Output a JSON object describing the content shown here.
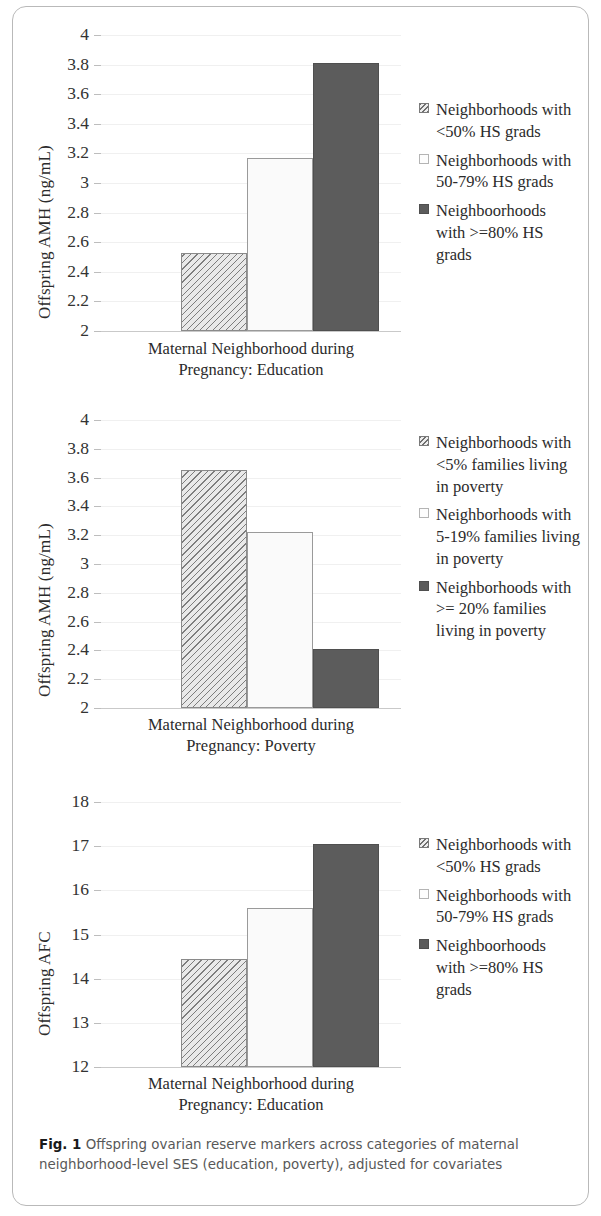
{
  "figure": {
    "caption_label": "Fig. 1",
    "caption_text": " Offspring ovarian reserve markers across categories of maternal neighborhood-level SES (education, poverty), adjusted for covariates"
  },
  "chart_data": [
    {
      "type": "bar",
      "title": "",
      "xlabel": "Maternal Neighborhood during Pregnancy: Education",
      "ylabel": "Offspring AMH (ng/mL)",
      "ylim": [
        2,
        4
      ],
      "ytick_labels": [
        "4",
        "3.8",
        "3.6",
        "3.4",
        "3.2",
        "3",
        "2.8",
        "2.6",
        "2.4",
        "2.2",
        "2"
      ],
      "ytick_values": [
        4,
        3.8,
        3.6,
        3.4,
        3.2,
        3,
        2.8,
        2.6,
        2.4,
        2.2,
        2
      ],
      "grid": true,
      "legend_position": "right",
      "categories": [
        "Neighborhoods with <50% HS grads",
        "Neighborhoods with 50-79% HS grads",
        "Neighboorhoods with >=80% HS grads"
      ],
      "values": [
        2.53,
        3.17,
        3.81
      ],
      "bar_styles": [
        "hatch",
        "white",
        "dark"
      ]
    },
    {
      "type": "bar",
      "title": "",
      "xlabel": "Maternal Neighborhood during Pregnancy: Poverty",
      "ylabel": "Offspring AMH (ng/mL)",
      "ylim": [
        2,
        4
      ],
      "ytick_labels": [
        "4",
        "3.8",
        "3.6",
        "3.4",
        "3.2",
        "3",
        "2.8",
        "2.6",
        "2.4",
        "2.2",
        "2"
      ],
      "ytick_values": [
        4,
        3.8,
        3.6,
        3.4,
        3.2,
        3,
        2.8,
        2.6,
        2.4,
        2.2,
        2
      ],
      "grid": true,
      "legend_position": "right",
      "categories": [
        "Neighborhoods with <5% families living in poverty",
        "Neighborhoods with 5-19% families living in poverty",
        "Neighborhoods with >= 20% families living in poverty"
      ],
      "values": [
        3.65,
        3.22,
        2.41
      ],
      "bar_styles": [
        "hatch",
        "white",
        "dark"
      ]
    },
    {
      "type": "bar",
      "title": "",
      "xlabel": "Maternal Neighborhood during Pregnancy: Education",
      "ylabel": "Offspring AFC",
      "ylim": [
        12,
        18
      ],
      "ytick_labels": [
        "18",
        "17",
        "16",
        "15",
        "14",
        "13",
        "12"
      ],
      "ytick_values": [
        18,
        17,
        16,
        15,
        14,
        13,
        12
      ],
      "grid": true,
      "legend_position": "right",
      "categories": [
        "Neighborhoods with <50% HS grads",
        "Neighborhoods with 50-79% HS grads",
        "Neighboorhoods with >=80% HS grads"
      ],
      "values": [
        14.45,
        15.6,
        17.05
      ],
      "bar_styles": [
        "hatch",
        "white",
        "dark"
      ]
    }
  ],
  "panels": [
    {
      "ylabel": "Offspring AMH (ng/mL)",
      "xaxis_line1": "Maternal Neighborhood during",
      "xaxis_line2": "Pregnancy: Education",
      "legend": [
        "Neighborhoods with <50% HS grads",
        "Neighborhoods with 50-79% HS grads",
        "Neighboorhoods with >=80% HS grads"
      ]
    },
    {
      "ylabel": "Offspring AMH (ng/mL)",
      "xaxis_line1": "Maternal Neighborhood during",
      "xaxis_line2": "Pregnancy: Poverty",
      "legend": [
        "Neighborhoods with <5% families living in poverty",
        "Neighborhoods with 5-19% families living in poverty",
        "Neighborhoods with >= 20% families living in poverty"
      ]
    },
    {
      "ylabel": "Offspring AFC",
      "xaxis_line1": "Maternal Neighborhood during",
      "xaxis_line2": "Pregnancy: Education",
      "legend": [
        "Neighborhoods with <50% HS grads",
        "Neighborhoods with 50-79% HS grads",
        "Neighboorhoods with >=80% HS grads"
      ]
    }
  ],
  "colors": {
    "bar_dark": "#5c5c5c",
    "bar_white": "#fafafa",
    "hatch_line": "#7d7d7d",
    "axis": "#c9c9c9",
    "text": "#2b2b2b"
  }
}
